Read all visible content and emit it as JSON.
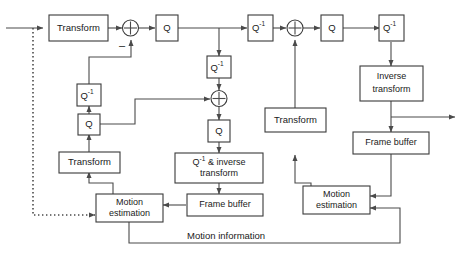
{
  "diagram": {
    "colors": {
      "line": "#4a4a4a",
      "box_stroke": "#3a3a3a",
      "text": "#1a1a1a",
      "background": "#ffffff"
    },
    "blocks": {
      "encoder_transform": "Transform",
      "encoder_q": "Q",
      "encoder_iq": "Q",
      "encoder_iq_inv": "Q",
      "encoder_local_q": "Q",
      "encoder_local_transform": "Transform",
      "encoder_motion_estimation_line1": "Motion",
      "encoder_motion_estimation_line2": "estimation",
      "encoder_inverse_block_line1": "Q",
      "encoder_inverse_block_line1_rest": " & inverse",
      "encoder_inverse_block_line2": "transform",
      "encoder_frame_buffer": "Frame buffer",
      "decoder_iq_left": "Q",
      "decoder_q": "Q",
      "decoder_iq_right": "Q",
      "decoder_transform": "Transform",
      "decoder_inverse_transform_line1": "Inverse",
      "decoder_inverse_transform_line2": "transform",
      "decoder_frame_buffer": "Frame buffer",
      "decoder_motion_estimation_line1": "Motion",
      "decoder_motion_estimation_line2": "estimation"
    },
    "superscripts": {
      "inverse": "-1"
    },
    "signs": {
      "subtract": "–"
    },
    "annotations": {
      "motion_information": "Motion information"
    }
  }
}
